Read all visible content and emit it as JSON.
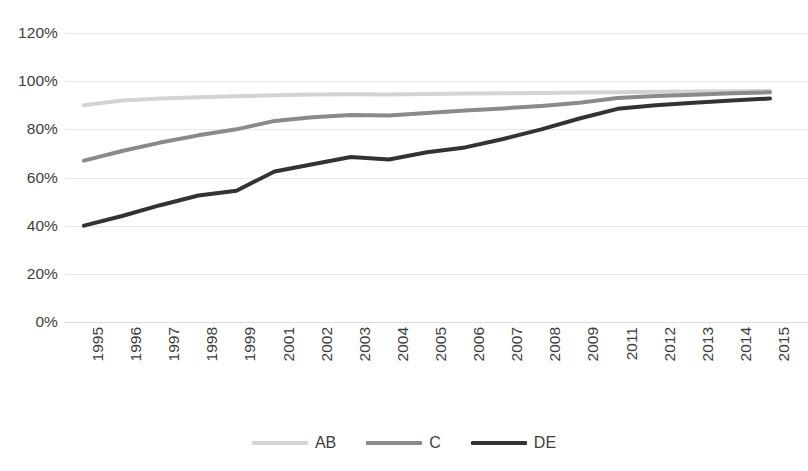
{
  "chart_data": {
    "type": "line",
    "title": "",
    "subtitle": "",
    "xlabel": "",
    "ylabel": "",
    "ylim": [
      0,
      120
    ],
    "y_ticks": [
      0,
      20,
      40,
      60,
      80,
      100,
      120
    ],
    "y_tick_labels": [
      "0%",
      "20%",
      "40%",
      "60%",
      "80%",
      "100%",
      "120%"
    ],
    "grid": true,
    "grid_axis": "y",
    "legend_position": "bottom",
    "categories": [
      "1995",
      "1996",
      "1997",
      "1998",
      "1999",
      "2001",
      "2002",
      "2003",
      "2004",
      "2005",
      "2006",
      "2007",
      "2008",
      "2009",
      "2011",
      "2012",
      "2013",
      "2014",
      "2015"
    ],
    "series": [
      {
        "name": "AB",
        "color": "#d3d3d3",
        "values": [
          90.0,
          92.0,
          92.8,
          93.3,
          93.7,
          94.2,
          94.5,
          94.6,
          94.5,
          94.7,
          94.9,
          95.0,
          95.1,
          95.3,
          95.4,
          95.6,
          95.7,
          95.8,
          96.0
        ]
      },
      {
        "name": "C",
        "color": "#8a8a8a",
        "values": [
          67.0,
          71.0,
          74.5,
          77.5,
          80.0,
          83.5,
          85.0,
          86.0,
          85.7,
          86.8,
          87.8,
          88.7,
          89.7,
          91.0,
          93.0,
          93.8,
          94.4,
          95.0,
          95.4
        ]
      },
      {
        "name": "DE",
        "color": "#333333",
        "values": [
          40.0,
          44.0,
          48.5,
          52.5,
          54.5,
          62.5,
          65.5,
          68.5,
          67.5,
          70.5,
          72.5,
          76.0,
          80.0,
          84.5,
          88.5,
          90.0,
          91.0,
          92.0,
          92.8
        ]
      }
    ]
  },
  "legend": {
    "items": [
      {
        "label": "AB",
        "color": "#d3d3d3"
      },
      {
        "label": "C",
        "color": "#8a8a8a"
      },
      {
        "label": "DE",
        "color": "#333333"
      }
    ]
  }
}
